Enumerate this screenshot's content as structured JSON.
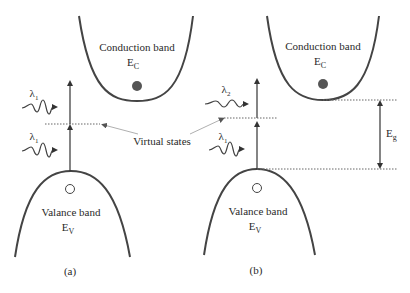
{
  "figure": {
    "panels": [
      {
        "id": "a",
        "caption": "(a)",
        "conduction_band": {
          "label": "Conduction band",
          "symbol": "E",
          "subscript": "C"
        },
        "valence_band": {
          "label": "Valance band",
          "symbol": "E",
          "subscript": "V"
        },
        "photons": [
          {
            "symbol": "λ",
            "subscript": "1"
          },
          {
            "symbol": "λ",
            "subscript": "1"
          }
        ]
      },
      {
        "id": "b",
        "caption": "(b)",
        "conduction_band": {
          "label": "Conduction band",
          "symbol": "E",
          "subscript": "C"
        },
        "valence_band": {
          "label": "Valance band",
          "symbol": "E",
          "subscript": "V"
        },
        "photons": [
          {
            "symbol": "λ",
            "subscript": "2"
          },
          {
            "symbol": "λ",
            "subscript": "1"
          }
        ],
        "band_gap": {
          "symbol": "E",
          "subscript": "g"
        }
      }
    ],
    "virtual_states_label": "Virtual states",
    "colors": {
      "line": "#444444",
      "electron": "#555555",
      "pointer": "#b0b0b0",
      "dotted": "#666666"
    }
  }
}
